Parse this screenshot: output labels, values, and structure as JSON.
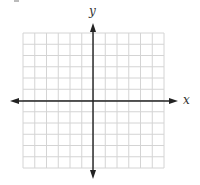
{
  "diagram": {
    "type": "cartesian-coordinate-grid",
    "axes": {
      "x_label": "x",
      "y_label": "y",
      "x_axis_arrows": "both",
      "y_axis_arrows": "both"
    },
    "grid": {
      "columns": 12,
      "rows": 12,
      "columns_left_of_y_axis": 6,
      "columns_right_of_y_axis": 6,
      "rows_above_x_axis": 6,
      "rows_below_x_axis": 6,
      "tick_labels": "none"
    },
    "colors": {
      "grid_line": "#d4d4d4",
      "axis_line": "#222222",
      "label": "#333333",
      "background": "#ffffff"
    }
  }
}
